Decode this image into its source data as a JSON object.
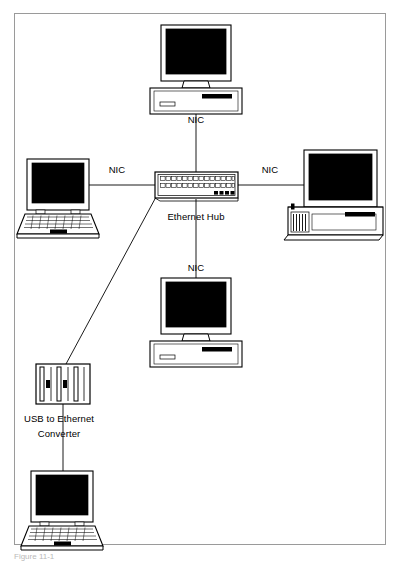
{
  "figure": {
    "kind": "network-topology-diagram",
    "caption": "Figure 11-1",
    "border_color": "#9a9a9a",
    "line_color": "#000000",
    "screen_fill": "#000000",
    "body_fill": "#ffffff"
  },
  "labels": {
    "nic_top": "NIC",
    "nic_left": "NIC",
    "nic_right": "NIC",
    "nic_bottom": "NIC",
    "hub": "Ethernet Hub",
    "converter_line1": "USB to Ethernet",
    "converter_line2": "Converter"
  },
  "nodes": [
    {
      "id": "desktop-top",
      "type": "desktop-computer",
      "label": "",
      "x": 196,
      "y": 70
    },
    {
      "id": "laptop-left",
      "type": "laptop-computer",
      "label": "",
      "x": 58,
      "y": 190
    },
    {
      "id": "ethernet-hub",
      "type": "ethernet-hub",
      "label": "Ethernet Hub",
      "x": 196,
      "y": 186,
      "ports": 28,
      "leds": 4
    },
    {
      "id": "desktop-right",
      "type": "tower-computer",
      "label": "",
      "x": 330,
      "y": 190
    },
    {
      "id": "desktop-bottom",
      "type": "desktop-computer",
      "label": "",
      "x": 196,
      "y": 312
    },
    {
      "id": "usb-converter",
      "type": "usb-to-ethernet-converter",
      "label": "USB to Ethernet Converter",
      "x": 58,
      "y": 388
    },
    {
      "id": "laptop-bottom",
      "type": "laptop-computer",
      "label": "",
      "x": 62,
      "y": 505
    }
  ],
  "links": [
    {
      "from": "desktop-top",
      "to": "ethernet-hub",
      "label": "NIC"
    },
    {
      "from": "laptop-left",
      "to": "ethernet-hub",
      "label": "NIC"
    },
    {
      "from": "desktop-right",
      "to": "ethernet-hub",
      "label": "NIC"
    },
    {
      "from": "desktop-bottom",
      "to": "ethernet-hub",
      "label": "NIC"
    },
    {
      "from": "usb-converter",
      "to": "ethernet-hub",
      "label": ""
    },
    {
      "from": "laptop-bottom",
      "to": "usb-converter",
      "label": ""
    }
  ]
}
